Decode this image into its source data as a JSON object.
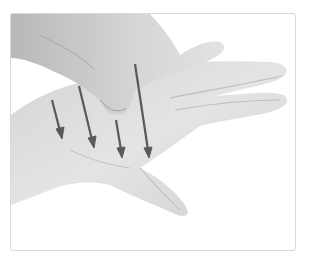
{
  "image": {
    "description": "Grayscale photo of one hand massaging the palm of another hand, with four downward arrows drawn across the palm",
    "background": "#ffffff",
    "frame_border": "#d9d9d9",
    "skin_light": "#e6e6e6",
    "skin_mid": "#cfcfcf",
    "skin_shadow": "#a8a8a8",
    "arrow_color": "#595959",
    "arrows": [
      {
        "x1": 52,
        "y1": 100,
        "x2": 62,
        "y2": 138
      },
      {
        "x1": 79,
        "y1": 86,
        "x2": 94,
        "y2": 147
      },
      {
        "x1": 116,
        "y1": 120,
        "x2": 122,
        "y2": 157
      },
      {
        "x1": 135,
        "y1": 64,
        "x2": 149,
        "y2": 157
      }
    ]
  }
}
